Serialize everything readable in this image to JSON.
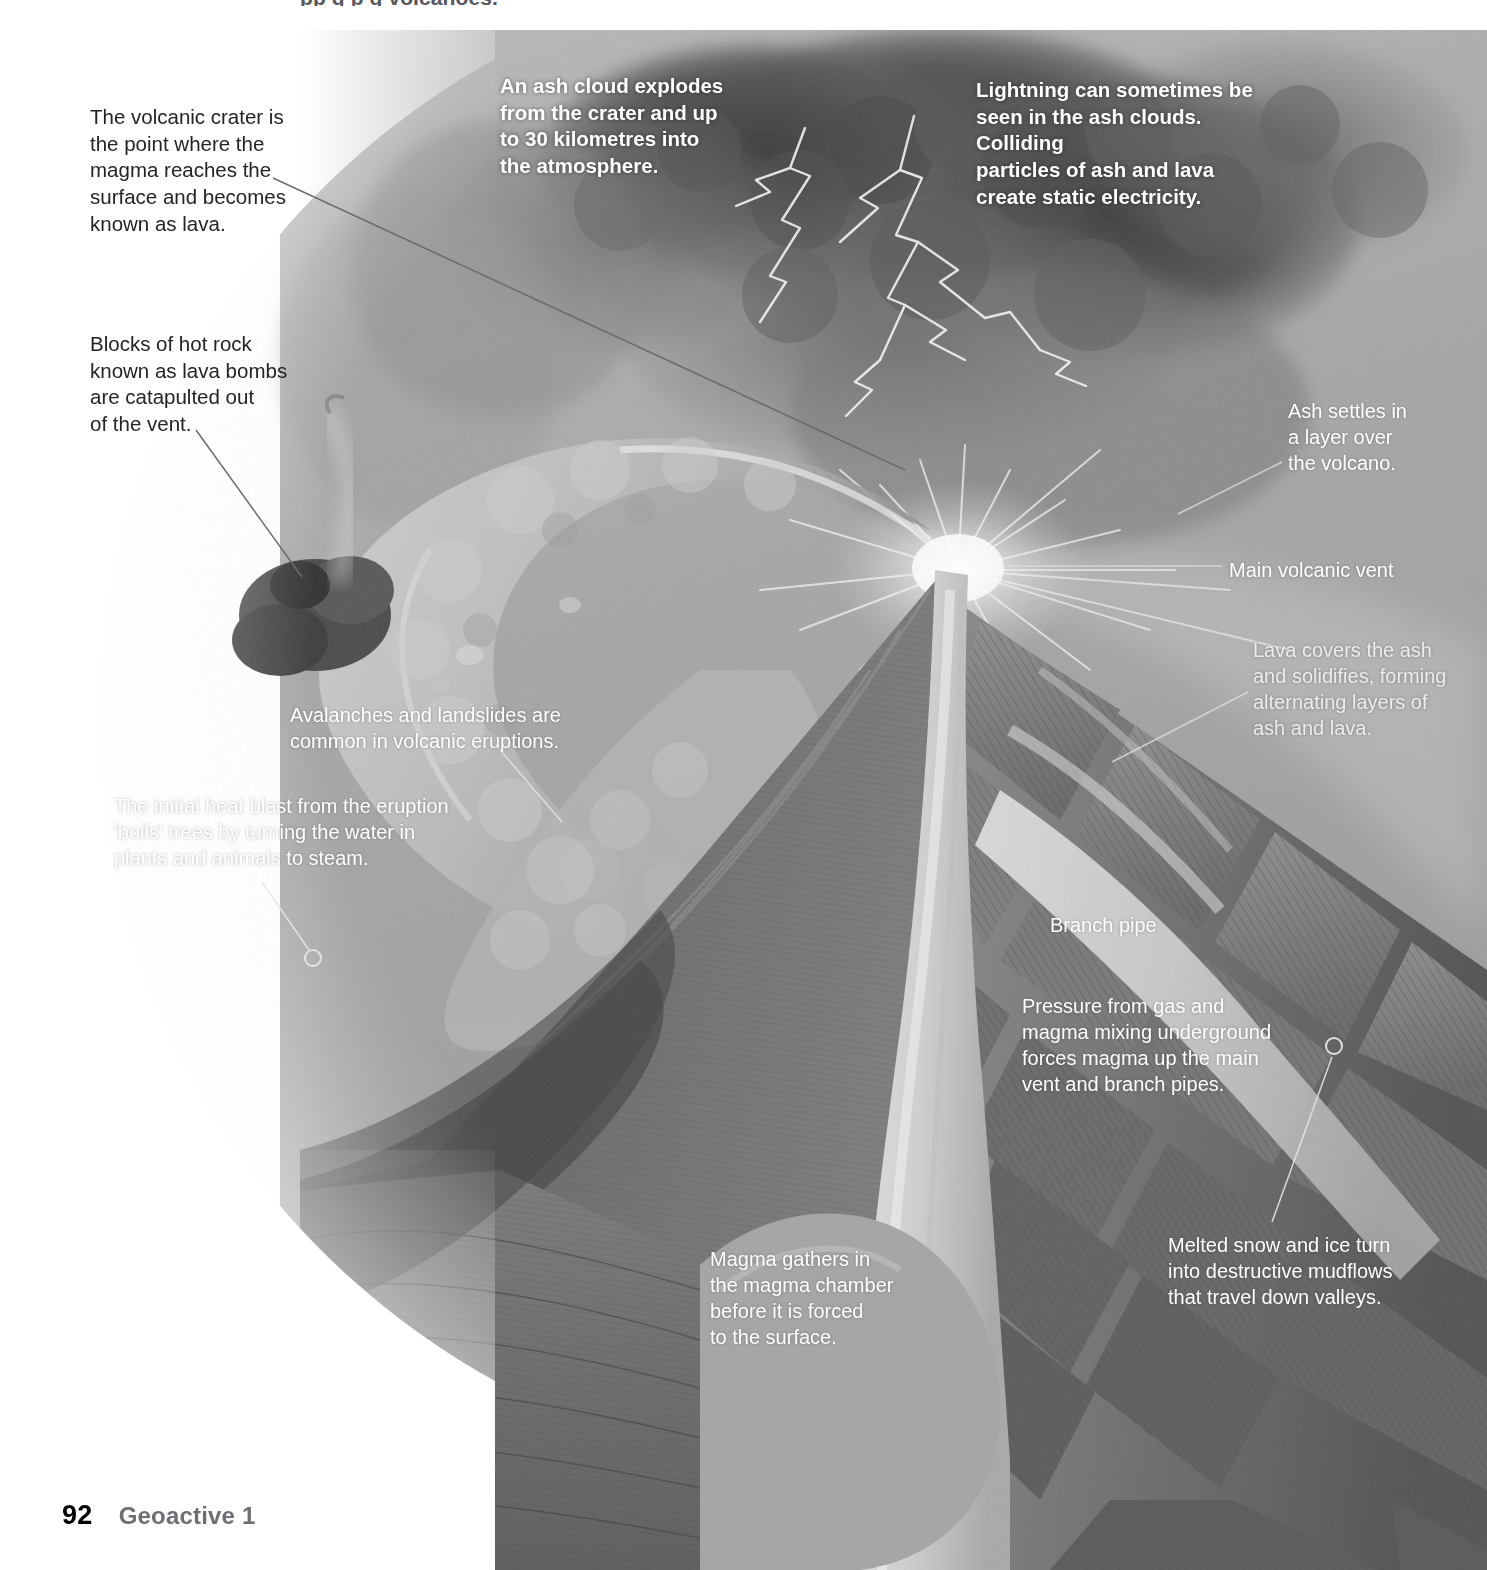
{
  "page": {
    "width": 1487,
    "height": 1570,
    "running_header": "pp   g  p g               volcanoes.",
    "footer": {
      "page_number": "92",
      "book_title": "Geoactive 1"
    }
  },
  "colors": {
    "text_dark": "#242428",
    "text_light": "#ffffff",
    "page_number": "#000000",
    "book_title": "#6e6e74",
    "leader_line_dark": "#6a6a70",
    "leader_line_light": "#e8e8e8",
    "illustration_base": "#9a9a9a"
  },
  "illustration": {
    "name": "volcano-cross-section",
    "description": "Greyscale cutaway illustration of an erupting stratovolcano with ash cloud, lightning, lava flows, layered cone, main vent, branch pipes and magma chamber."
  },
  "annotations": [
    {
      "id": "volcanic-crater",
      "style": "dark",
      "text": "The volcanic crater is\nthe point where the\nmagma reaches the\nsurface and becomes\nknown as lava.",
      "x": 90,
      "y": 104,
      "width": 210
    },
    {
      "id": "lava-bombs",
      "style": "dark",
      "text": "Blocks of hot rock\nknown as lava bombs\nare catapulted out\nof the vent.",
      "x": 90,
      "y": 331,
      "width": 210
    },
    {
      "id": "ash-cloud",
      "style": "light-bold",
      "text": "An ash cloud explodes\nfrom the crater and up\nto 30 kilometres into\nthe atmosphere.",
      "x": 500,
      "y": 73,
      "width": 230
    },
    {
      "id": "lightning",
      "style": "light-bold",
      "text": "Lightning can sometimes be\nseen in the ash clouds. Colliding\nparticles of ash and lava\ncreate static electricity.",
      "x": 976,
      "y": 77,
      "width": 300
    },
    {
      "id": "ash-settles",
      "style": "light",
      "text": "Ash settles in\na layer over\nthe volcano.",
      "x": 1288,
      "y": 398,
      "width": 180
    },
    {
      "id": "main-volcanic-vent",
      "style": "light",
      "text": "Main volcanic vent",
      "x": 1229,
      "y": 557,
      "width": 230
    },
    {
      "id": "lava-layers",
      "style": "light-dim",
      "text": "Lava covers the ash\nand solidifies, forming\nalternating layers of\nash and lava.",
      "x": 1253,
      "y": 637,
      "width": 225
    },
    {
      "id": "avalanches",
      "style": "light",
      "text": "Avalanches and landslides are\ncommon in volcanic eruptions.",
      "x": 290,
      "y": 702,
      "width": 300
    },
    {
      "id": "heat-blast",
      "style": "light",
      "text": "The initial heat blast from the eruption\n'boils' trees by turning the water in\nplants and animals to steam.",
      "x": 114,
      "y": 793,
      "width": 350
    },
    {
      "id": "branch-pipe",
      "style": "light",
      "text": "Branch pipe",
      "x": 1050,
      "y": 912,
      "width": 180
    },
    {
      "id": "pressure",
      "style": "light",
      "text": "Pressure from gas and\nmagma mixing underground\nforces magma up the main\nvent and branch pipes.",
      "x": 1022,
      "y": 993,
      "width": 250
    },
    {
      "id": "magma-chamber",
      "style": "light",
      "text": "Magma gathers in\nthe magma chamber\nbefore it is forced\nto the surface.",
      "x": 710,
      "y": 1246,
      "width": 200
    },
    {
      "id": "mudflows",
      "style": "light",
      "text": "Melted snow and ice turn\ninto destructive mudflows\nthat travel down valleys.",
      "x": 1168,
      "y": 1232,
      "width": 250
    }
  ],
  "leader_lines": [
    {
      "id": "crater-leader",
      "from": [
        273,
        178
      ],
      "to": [
        905,
        470
      ],
      "marker": "none",
      "tone": "dark"
    },
    {
      "id": "lava-bomb-leader",
      "from": [
        196,
        430
      ],
      "to": [
        300,
        575
      ],
      "marker": "none",
      "tone": "dark"
    },
    {
      "id": "ash-settles-leader",
      "from": [
        1282,
        462
      ],
      "to": [
        1185,
        512
      ],
      "marker": "none",
      "tone": "light"
    },
    {
      "id": "main-vent-leader",
      "from": [
        1223,
        566
      ],
      "to": [
        1000,
        566
      ],
      "marker": "none",
      "tone": "light"
    },
    {
      "id": "lava-layers-leader",
      "from": [
        1248,
        690
      ],
      "to": [
        1110,
        760
      ],
      "marker": "none",
      "tone": "light"
    },
    {
      "id": "avalanche-leader",
      "from": [
        500,
        748
      ],
      "to": [
        560,
        820
      ],
      "marker": "none",
      "tone": "light"
    },
    {
      "id": "heat-blast-leader",
      "from": [
        262,
        880
      ],
      "to": [
        312,
        953
      ],
      "marker": "circle",
      "tone": "light"
    },
    {
      "id": "mudflow-leader",
      "from": [
        1275,
        1222
      ],
      "to": [
        1333,
        1047
      ],
      "marker": "circle",
      "tone": "light"
    }
  ]
}
